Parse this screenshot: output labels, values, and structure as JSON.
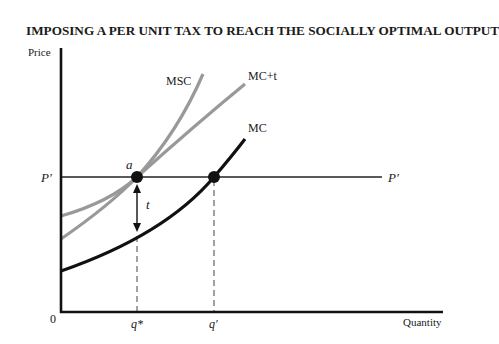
{
  "title": "IMPOSING A PER UNIT TAX TO REACH THE SOCIALLY OPTIMAL OUTPUT",
  "axes": {
    "y_label": "Price",
    "x_label": "Quantity",
    "origin_label": "0"
  },
  "ticks": {
    "q_star": "q*",
    "q_prime": "q′"
  },
  "price_line": {
    "left_label": "P′",
    "right_label": "P′"
  },
  "curves": {
    "msc": "MSC",
    "mc_plus_t": "MC+t",
    "mc": "MC"
  },
  "points": {
    "a": "a"
  },
  "tax_arrow_label": "t",
  "colors": {
    "mc": "#111111",
    "shifted_curves": "#999999",
    "axes": "#111111"
  }
}
